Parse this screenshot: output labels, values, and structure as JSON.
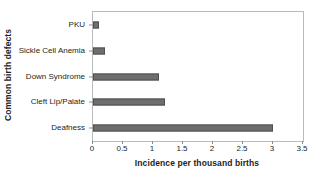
{
  "chart_data": {
    "type": "bar",
    "orientation": "horizontal",
    "title": "",
    "xlabel": "Incidence per thousand births",
    "ylabel": "Common birth defects",
    "categories": [
      "PKU",
      "Sickle Cell Anemia",
      "Down Syndrome",
      "Cleft Lip/Palate",
      "Deafness"
    ],
    "values": [
      0.1,
      0.2,
      1.1,
      1.2,
      3.0
    ],
    "xlim": [
      0,
      3.5
    ],
    "xticks": [
      0,
      0.5,
      1,
      1.5,
      2,
      2.5,
      3,
      3.5
    ],
    "xtick_labels": [
      "0",
      "0.5",
      "1",
      "1.5",
      "2",
      "2.5",
      "3",
      "3.5"
    ],
    "grid": false,
    "legend": false,
    "bar_color": "#6e6e6e",
    "bar_edge_color": "#4f4f4f",
    "frame_color": "#b9babc",
    "text_color": "#231f20"
  }
}
